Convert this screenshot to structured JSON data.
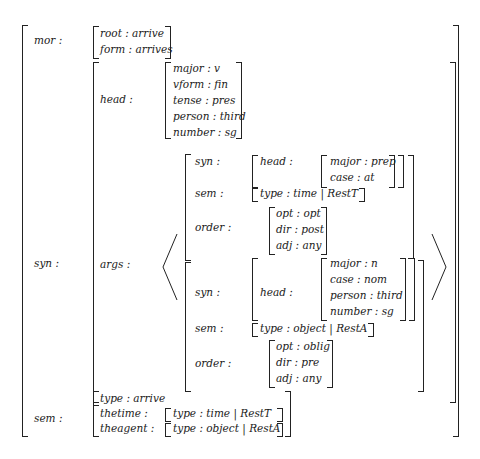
{
  "avm": {
    "mor": {
      "label": "mor :",
      "root": "root : arrive",
      "form": "form : arrives"
    },
    "syn": {
      "label": "syn :",
      "head": {
        "label": "head :",
        "major": "major : v",
        "vform": "vform : fin",
        "tense": "tense : pres",
        "person": "person : third",
        "number": "number : sg"
      },
      "args": {
        "label": "args :",
        "items": [
          {
            "syn_label": "syn :",
            "head_label": "head :",
            "head": [
              "major : prep",
              "case : at"
            ],
            "sem_label": "sem :",
            "sem": "type : time  |  RestT",
            "order_label": "order :",
            "order": [
              "opt : opt",
              "dir : post",
              "adj : any"
            ]
          },
          {
            "syn_label": "syn :",
            "head_label": "head :",
            "head": [
              "major : n",
              "case : nom",
              "person : third",
              "number : sg"
            ],
            "sem_label": "sem :",
            "sem": "type : object  |  RestA",
            "order_label": "order :",
            "order": [
              "opt : oblig",
              "dir : pre",
              "adj : any"
            ]
          }
        ]
      }
    },
    "sem": {
      "label": "sem :",
      "type": "type : arrive",
      "thetime_label": "thetime :",
      "thetime": "type : time  |  RestT",
      "theagent_label": "theagent :",
      "theagent": "type : object  |  RestA"
    }
  }
}
